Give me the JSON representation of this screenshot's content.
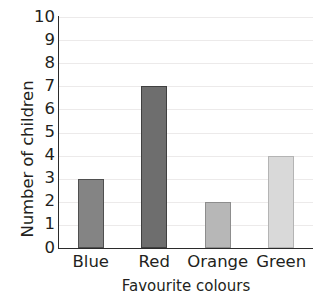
{
  "chart_data": {
    "type": "bar",
    "title": "",
    "xlabel": "Favourite colours",
    "ylabel": "Number of children",
    "categories": [
      "Blue",
      "Red",
      "Orange",
      "Green"
    ],
    "values": [
      3,
      7,
      2,
      4
    ],
    "ylim": [
      0,
      10
    ],
    "yticks": [
      0,
      1,
      2,
      3,
      4,
      5,
      6,
      7,
      8,
      9,
      10
    ],
    "ytick_labels": [
      "0",
      "1",
      "2",
      "3",
      "4",
      "5",
      "6",
      "7",
      "8",
      "9",
      "10"
    ],
    "grid": true,
    "grid_axis": "y",
    "legend": false,
    "legend_position": "none",
    "bar_colors": [
      "#848484",
      "#6e6e6e",
      "#b7b7b7",
      "#d9d9d9"
    ],
    "bar_edge_colors": [
      "#4f4f4f",
      "#404040",
      "#8d8d8d",
      "#b4b4b4"
    ],
    "axis_color": "#2b2b2b",
    "gridline_color": "#eceaea",
    "text_color": "#231f20",
    "background": "#ffffff"
  }
}
